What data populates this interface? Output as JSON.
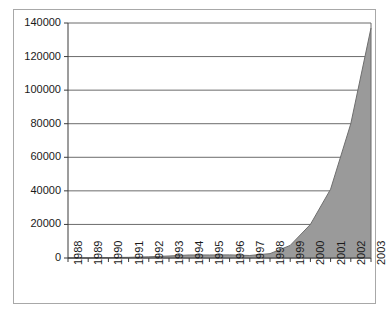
{
  "chart_data": {
    "type": "area",
    "title": "",
    "subtitle": "",
    "xlabel": "",
    "ylabel": "",
    "categories": [
      "1988",
      "1989",
      "1990",
      "1991",
      "1992",
      "1993",
      "1994",
      "1995",
      "1996",
      "1997",
      "1998",
      "1999",
      "2000",
      "2001",
      "2002",
      "2003"
    ],
    "values": [
      0,
      30,
      250,
      400,
      700,
      1200,
      1800,
      1800,
      1850,
      1500,
      2600,
      7500,
      20000,
      41000,
      80000,
      137000
    ],
    "series": [
      {
        "name": "series-1",
        "values": [
          0,
          30,
          250,
          400,
          700,
          1200,
          1800,
          1800,
          1850,
          1500,
          2600,
          7500,
          20000,
          41000,
          80000,
          137000
        ]
      }
    ],
    "ylim": [
      0,
      140000
    ],
    "yticks": [
      0,
      20000,
      40000,
      60000,
      80000,
      100000,
      120000,
      140000
    ],
    "ytick_labels": [
      "0",
      "20000",
      "40000",
      "60000",
      "80000",
      "100000",
      "120000",
      "140000"
    ],
    "xtick_labels": [
      "1988",
      "1989",
      "1990",
      "1991",
      "1992",
      "1993",
      "1994",
      "1995",
      "1996",
      "1997",
      "1998",
      "1999",
      "2000",
      "2001",
      "2002",
      "2003"
    ],
    "grid": {
      "horizontal": true,
      "vertical": false
    },
    "legend": {
      "visible": false,
      "position": "none",
      "entries": []
    },
    "colors": {
      "area_fill": "#9a9a9a",
      "area_stroke": "#6e6e6e",
      "gridline": "#6b6b6b",
      "axis": "#3a3a3a",
      "frame": "#a8a8a8",
      "plot_background": "#ffffff",
      "figure_background": "#ffffff",
      "tick_text": "#1a1a1a"
    },
    "annotations": []
  }
}
